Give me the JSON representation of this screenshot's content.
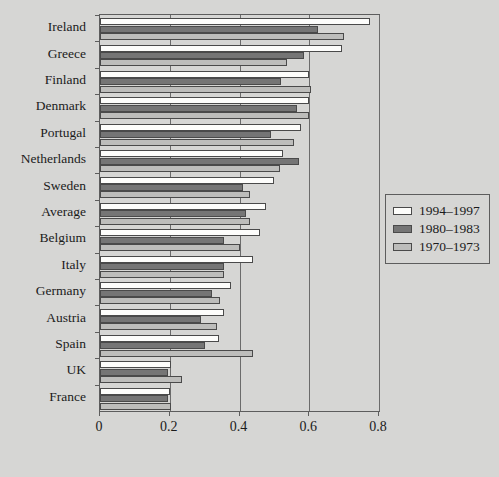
{
  "chart_data": {
    "type": "bar",
    "orientation": "horizontal",
    "title": "",
    "xlabel": "",
    "ylabel": "",
    "xlim": [
      0,
      0.8
    ],
    "xticks": [
      0,
      0.2,
      0.4,
      0.6,
      0.8
    ],
    "xtick_labels": [
      "0",
      "0.2",
      "0.4",
      "0.6",
      "0.8"
    ],
    "grid": true,
    "grid_axis": "x",
    "legend_position": "right",
    "categories": [
      "Ireland",
      "Greece",
      "Finland",
      "Denmark",
      "Portugal",
      "Netherlands",
      "Sweden",
      "Average",
      "Belgium",
      "Italy",
      "Germany",
      "Austria",
      "Spain",
      "UK",
      "France"
    ],
    "series": [
      {
        "name": "1994–1997",
        "color": "#fdfdfb",
        "values": [
          0.775,
          0.695,
          0.6,
          0.6,
          0.575,
          0.525,
          0.5,
          0.475,
          0.46,
          0.44,
          0.375,
          0.355,
          0.34,
          0.205,
          0.2
        ]
      },
      {
        "name": "1980–1983",
        "color": "#757575",
        "values": [
          0.625,
          0.585,
          0.52,
          0.565,
          0.49,
          0.57,
          0.41,
          0.42,
          0.355,
          0.355,
          0.32,
          0.29,
          0.3,
          0.195,
          0.195
        ]
      },
      {
        "name": "1970–1973",
        "color": "#bdbdbb",
        "values": [
          0.7,
          0.535,
          0.605,
          0.6,
          0.555,
          0.515,
          0.43,
          0.43,
          0.4,
          0.355,
          0.345,
          0.335,
          0.44,
          0.235,
          0.205
        ]
      }
    ]
  },
  "legend": {
    "entries": [
      {
        "label": "1994–1997",
        "swatch": "white-swatch"
      },
      {
        "label": "1980–1983",
        "swatch": "dark-gray-swatch"
      },
      {
        "label": "1970–1973",
        "swatch": "light-gray-swatch"
      }
    ]
  },
  "colors": {
    "background": "#d6d6d4",
    "axis": "#5d5d5d",
    "series_1994_1997": "#fdfdfb",
    "series_1980_1983": "#757575",
    "series_1970_1973": "#bdbdbb"
  }
}
